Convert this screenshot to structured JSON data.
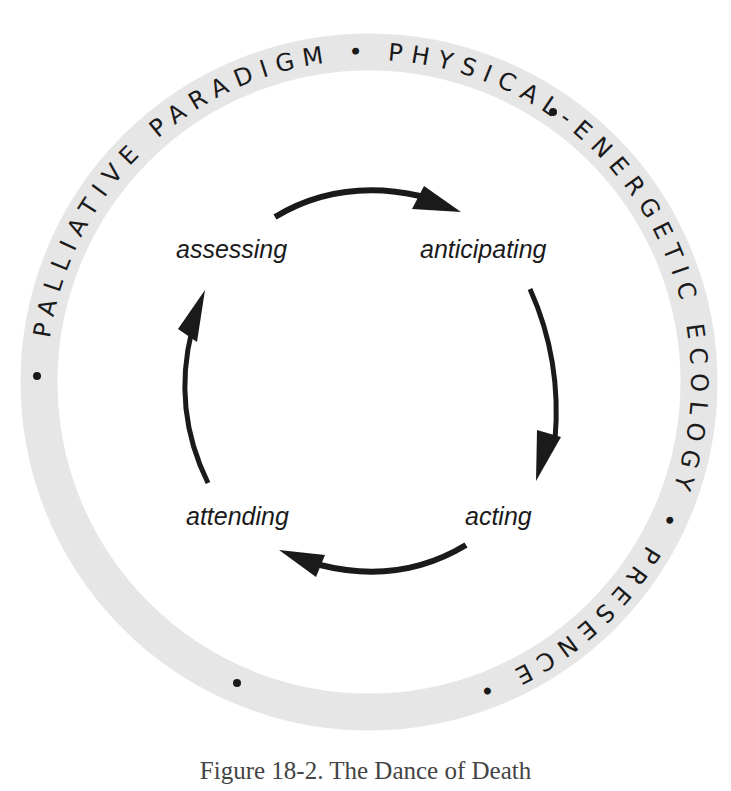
{
  "diagram": {
    "type": "cycle",
    "ring": {
      "text_segments": [
        "PALLIATIVE PARADIGM",
        "PHYSICAL-ENERGETIC ECOLOGY",
        "PRESENCE"
      ],
      "separator": "•",
      "full_text": "PALLIATIVE PARADIGM • PHYSICAL-ENERGETIC ECOLOGY • PRESENCE •",
      "band_color": "#e6e6e6",
      "text_color": "#1a1a1a"
    },
    "nodes": [
      {
        "id": "assessing",
        "label": "assessing"
      },
      {
        "id": "anticipating",
        "label": "anticipating"
      },
      {
        "id": "acting",
        "label": "acting"
      },
      {
        "id": "attending",
        "label": "attending"
      }
    ],
    "edges": [
      {
        "from": "assessing",
        "to": "anticipating"
      },
      {
        "from": "anticipating",
        "to": "acting"
      },
      {
        "from": "acting",
        "to": "attending"
      },
      {
        "from": "attending",
        "to": "assessing"
      }
    ],
    "arrow_color": "#1a1a1a"
  },
  "caption": "Figure 18-2. The Dance of Death"
}
